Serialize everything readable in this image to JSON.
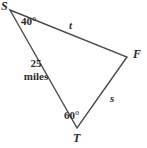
{
  "figure": {
    "type": "triangle-diagram",
    "background_color": "#ffffff",
    "stroke_color": "#4a4a4a",
    "text_color": "#2b2b2b",
    "vertices": [
      {
        "id": "S",
        "label": "S",
        "x": 10,
        "y": 10
      },
      {
        "id": "F",
        "label": "F",
        "x": 127,
        "y": 57
      },
      {
        "id": "T",
        "label": "T",
        "x": 77,
        "y": 128
      }
    ],
    "angles": [
      {
        "at": "S",
        "label": "40°"
      },
      {
        "at": "T",
        "label": "60°"
      }
    ],
    "sides": [
      {
        "from": "S",
        "to": "F",
        "label": "t"
      },
      {
        "from": "F",
        "to": "T",
        "label": "s"
      },
      {
        "from": "S",
        "to": "T",
        "label_line1": "25",
        "label_line2": "miles"
      }
    ]
  }
}
